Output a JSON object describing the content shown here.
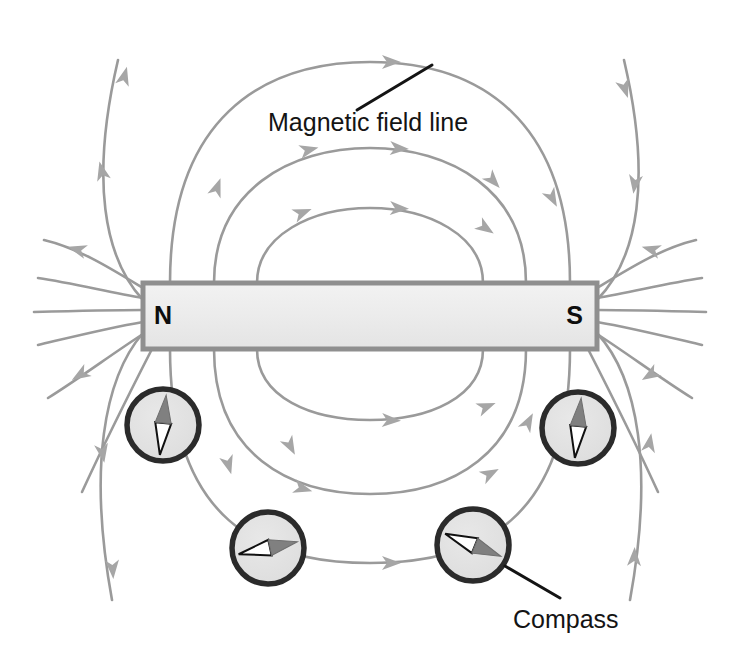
{
  "figure": {
    "background_color": "#ffffff",
    "width": 741,
    "height": 649
  },
  "magnet": {
    "name": "bar-magnet",
    "north_label": "N",
    "south_label": "S",
    "fill_color": "#e9e9e9",
    "border_color": "#8f8f8f",
    "x": 143,
    "y": 283,
    "width": 454,
    "height": 66
  },
  "annotations": [
    {
      "id": "magnetic-field-line",
      "label": "Magnetic field line",
      "label_x": 268,
      "label_y": 122,
      "leader_from": [
        357,
        110
      ],
      "leader_to": [
        432,
        65
      ],
      "color": "#141414"
    },
    {
      "id": "compass",
      "label": "Compass",
      "label_x": 513,
      "label_y": 620,
      "leader_from": [
        560,
        598
      ],
      "leader_to": [
        505,
        566
      ],
      "color": "#141414"
    }
  ],
  "field_lines": {
    "name": "magnetic-field-lines",
    "stroke_color": "#9a9a9a",
    "stroke_width": 2.6,
    "arrow_color": "#a6a6a6",
    "direction": "north-to-south",
    "top_arc_apex_y": [
      62,
      148,
      208
    ],
    "bottom_arc_apex_y": [
      420,
      494,
      563
    ],
    "count_closed_loops": 3,
    "count_pole_rays": 12
  },
  "compasses": [
    {
      "id": "compass-upper-left",
      "cx": 163,
      "cy": 425,
      "r": 38,
      "needle_angle_deg": 186,
      "face_color": "#e2e2e2",
      "ring_color": "#2b2b2b",
      "white_half": "north-seeking",
      "gray_half": "south-seeking"
    },
    {
      "id": "compass-lower-left",
      "cx": 268,
      "cy": 548,
      "r": 38,
      "needle_angle_deg": 258,
      "face_color": "#e2e2e2",
      "ring_color": "#2b2b2b",
      "white_half": "north-seeking",
      "gray_half": "south-seeking"
    },
    {
      "id": "compass-lower-right",
      "cx": 473,
      "cy": 545,
      "r": 38,
      "needle_angle_deg": 292,
      "face_color": "#e2e2e2",
      "ring_color": "#2b2b2b",
      "white_half": "north-seeking",
      "gray_half": "south-seeking"
    },
    {
      "id": "compass-upper-right",
      "cx": 578,
      "cy": 428,
      "r": 38,
      "needle_angle_deg": 6,
      "face_color": "#e2e2e2",
      "ring_color": "#2b2b2b",
      "white_half": "north-seeking",
      "gray_half": "south-seeking"
    }
  ]
}
